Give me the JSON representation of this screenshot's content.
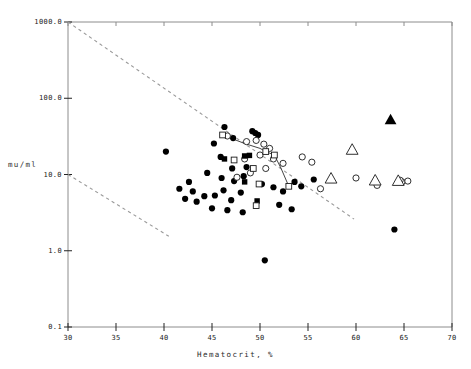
{
  "chart_data": {
    "type": "scatter",
    "title": "",
    "xlabel": "Hematocrit, %",
    "ylabel": "mu/ml",
    "xlim": [
      30,
      70
    ],
    "ylim": [
      0.1,
      1000
    ],
    "yscale": "log",
    "xscale": "linear",
    "grid": false,
    "legend": "none",
    "xticks": [
      30,
      35,
      40,
      45,
      50,
      55,
      60,
      65,
      70
    ],
    "xticklabels": [
      "30",
      "35",
      "40",
      "45",
      "50",
      "55",
      "60",
      "65",
      "70"
    ],
    "yticks": [
      0.1,
      1.0,
      10.0,
      100.0,
      1000.0
    ],
    "yticklabels": [
      "0.1",
      "1.0",
      "10.0",
      "100.0",
      "1000.0"
    ],
    "series": [
      {
        "name": "filled-circle",
        "marker": "filled-circle",
        "color": "#000000",
        "points": [
          [
            40.2,
            20.0
          ],
          [
            45.2,
            25.5
          ],
          [
            46.3,
            42.0
          ],
          [
            47.2,
            30.0
          ],
          [
            49.2,
            37.0
          ],
          [
            49.5,
            35.0
          ],
          [
            49.8,
            33.0
          ],
          [
            45.9,
            17.0
          ],
          [
            47.1,
            12.0
          ],
          [
            48.6,
            12.5
          ],
          [
            44.5,
            10.5
          ],
          [
            46.0,
            9.0
          ],
          [
            47.3,
            8.2
          ],
          [
            48.3,
            9.5
          ],
          [
            42.6,
            8.0
          ],
          [
            43.0,
            6.0
          ],
          [
            44.2,
            5.2
          ],
          [
            45.3,
            5.3
          ],
          [
            46.2,
            6.2
          ],
          [
            47.0,
            4.6
          ],
          [
            48.0,
            5.8
          ],
          [
            41.6,
            6.5
          ],
          [
            42.2,
            4.8
          ],
          [
            43.4,
            4.4
          ],
          [
            45.0,
            3.6
          ],
          [
            46.6,
            3.4
          ],
          [
            48.2,
            3.2
          ],
          [
            50.2,
            7.5
          ],
          [
            51.4,
            6.8
          ],
          [
            52.4,
            6.0
          ],
          [
            53.6,
            8.0
          ],
          [
            54.3,
            7.0
          ],
          [
            52.0,
            4.0
          ],
          [
            53.3,
            3.5
          ],
          [
            50.5,
            0.75
          ],
          [
            64.0,
            1.9
          ],
          [
            55.6,
            8.6
          ]
        ]
      },
      {
        "name": "open-circle",
        "marker": "open-circle",
        "color": "#1a1a1a",
        "points": [
          [
            46.6,
            32.0
          ],
          [
            48.6,
            27.0
          ],
          [
            49.6,
            28.0
          ],
          [
            50.4,
            25.0
          ],
          [
            51.0,
            22.0
          ],
          [
            50.0,
            18.0
          ],
          [
            48.4,
            16.0
          ],
          [
            49.0,
            10.5
          ],
          [
            47.6,
            9.2
          ],
          [
            51.4,
            16.0
          ],
          [
            52.4,
            14.0
          ],
          [
            50.6,
            12.0
          ],
          [
            54.4,
            17.0
          ],
          [
            55.4,
            14.5
          ],
          [
            56.3,
            6.5
          ],
          [
            60.0,
            9.0
          ],
          [
            64.8,
            8.0
          ],
          [
            65.4,
            8.2
          ],
          [
            64.6,
            8.4
          ],
          [
            62.0,
            8.0
          ],
          [
            62.2,
            7.2
          ]
        ]
      },
      {
        "name": "filled-square",
        "marker": "filled-square",
        "color": "#000000",
        "points": [
          [
            46.3,
            16.0
          ],
          [
            48.4,
            17.5
          ],
          [
            48.9,
            17.8
          ],
          [
            48.4,
            8.0
          ],
          [
            49.7,
            4.5
          ]
        ]
      },
      {
        "name": "open-square",
        "marker": "open-square",
        "color": "#1a1a1a",
        "points": [
          [
            46.1,
            33.0
          ],
          [
            47.3,
            15.5
          ],
          [
            49.3,
            12.0
          ],
          [
            50.6,
            20.0
          ],
          [
            51.5,
            18.0
          ],
          [
            49.9,
            7.5
          ],
          [
            53.0,
            7.0
          ],
          [
            49.6,
            3.9
          ]
        ]
      },
      {
        "name": "open-triangle",
        "marker": "open-triangle",
        "color": "#1a1a1a",
        "points": [
          [
            59.6,
            21.0
          ],
          [
            57.4,
            8.8
          ],
          [
            62.0,
            8.3
          ],
          [
            64.4,
            8.2
          ]
        ]
      },
      {
        "name": "filled-triangle",
        "marker": "filled-triangle",
        "color": "#000000",
        "points": [
          [
            63.6,
            52.0
          ]
        ]
      }
    ],
    "connector_path": {
      "name": "connected-square-path",
      "points": [
        [
          46.1,
          33.0
        ],
        [
          48.4,
          25.5
        ],
        [
          50.0,
          22.0
        ],
        [
          50.6,
          20.0
        ],
        [
          51.5,
          18.0
        ],
        [
          52.2,
          12.0
        ],
        [
          53.0,
          7.0
        ]
      ]
    },
    "reference_lines": [
      {
        "name": "upper-dashed-line",
        "style": "dashed",
        "from": [
          30,
          1000
        ],
        "to": [
          59.8,
          2.6
        ]
      },
      {
        "name": "lower-dashed-line",
        "style": "dashed",
        "from": [
          30,
          10.0
        ],
        "to": [
          40.5,
          1.55
        ]
      }
    ]
  }
}
